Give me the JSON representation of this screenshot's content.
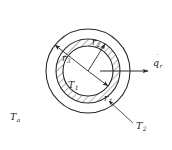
{
  "figure": {
    "background_color": "#ffffff",
    "line_color": "#2b2b2b",
    "hatch_color": "#3a3a3a",
    "center": {
      "x": 88,
      "y": 71
    }
  },
  "circles": [
    {
      "name": "inner-surface",
      "label": "r1",
      "radius": 25,
      "role": "inner radius of hatched wall"
    },
    {
      "name": "middle-surface",
      "label": "r2",
      "radius": 32,
      "role": "outer radius of hatched wall"
    },
    {
      "name": "outer-surface",
      "label": "r3",
      "radius": 42,
      "role": "outer boundary to ambient"
    }
  ],
  "hatched_region": {
    "name": "wall-annulus",
    "inner_radius": 25,
    "outer_radius": 32,
    "pattern": "diagonal-hatch",
    "angle_deg": 45
  },
  "labels": {
    "r1": {
      "text": "r",
      "sub": "1",
      "x": 104,
      "y": 101
    },
    "r2": {
      "text": "r",
      "sub": "2",
      "x": 92,
      "y": 45
    },
    "r3": {
      "text": "r",
      "sub": "3",
      "x": 62,
      "y": 61
    },
    "T1": {
      "text": "T",
      "sub": "1",
      "x": 68,
      "y": 88
    },
    "T2": {
      "text": "T",
      "sub": "2",
      "x": 136,
      "y": 129
    },
    "Ta": {
      "text": "T",
      "sub": "a",
      "x": 10,
      "y": 120
    },
    "qr": {
      "text": "q",
      "sub": "r",
      "dot": "˙",
      "x": 153,
      "y": 64
    }
  },
  "arrows": [
    {
      "name": "radius-arrow-r1",
      "from": "center",
      "to_label": "r1",
      "points_to": "inner-surface",
      "angle_deg": 37
    },
    {
      "name": "radius-arrow-r2",
      "from": "center",
      "to_label": "r2",
      "points_to": "middle-surface",
      "angle_deg": -57
    },
    {
      "name": "radius-arrow-r3",
      "from": "center",
      "to_label": "r3",
      "points_to": "outer-surface",
      "angle_deg": -142
    },
    {
      "name": "heat-flux-arrow",
      "to_label": "qr",
      "direction": "radially outward",
      "angle_deg": 0
    },
    {
      "name": "leader-arrow-T2",
      "to_label": "T2",
      "points_to": "middle-surface"
    }
  ],
  "legend_notes": {
    "T1": "inner surface temperature",
    "T2": "outer wall surface temperature",
    "Ta": "ambient temperature",
    "qr": "radial heat flux"
  }
}
